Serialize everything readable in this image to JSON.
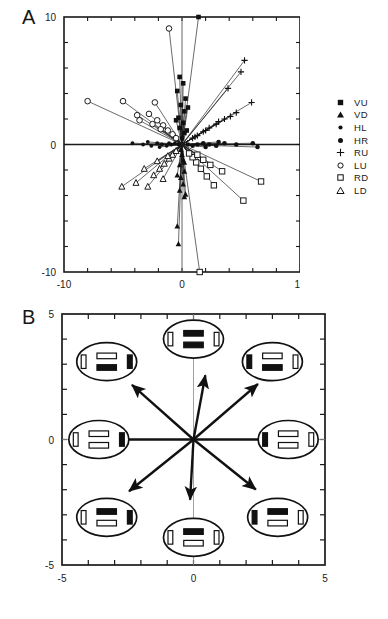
{
  "figure": {
    "panels": [
      {
        "letter": "A",
        "type": "scatter-vector"
      },
      {
        "letter": "B",
        "type": "vector-diagram"
      }
    ]
  },
  "panel_a": {
    "letter": "A",
    "y_ticks": [
      "10",
      "0",
      "-10"
    ],
    "x_ticks": [
      "-10",
      "0",
      "10"
    ],
    "legend": [
      {
        "label": "VU",
        "symbol": "filled-square"
      },
      {
        "label": "VD",
        "symbol": "filled-triangle"
      },
      {
        "label": "HL",
        "symbol": "filled-circle-small"
      },
      {
        "label": "HR",
        "symbol": "filled-circle"
      },
      {
        "label": "RU",
        "symbol": "plus"
      },
      {
        "label": "LU",
        "symbol": "open-circle"
      },
      {
        "label": "RD",
        "symbol": "open-square"
      },
      {
        "label": "LD",
        "symbol": "open-triangle"
      }
    ]
  },
  "panel_b": {
    "letter": "B",
    "y_ticks": [
      "5",
      "0",
      "-5"
    ],
    "x_ticks": [
      "-5",
      "0",
      "5"
    ],
    "icons": [
      {
        "name": "eye-icon-up",
        "direction": "up",
        "top_bar": "black",
        "bottom_bar": "black",
        "left_bar": "white",
        "right_bar": "white"
      },
      {
        "name": "eye-icon-up-left",
        "direction": "up-left",
        "top_bar": "white",
        "bottom_bar": "black",
        "left_bar": "white",
        "right_bar": "black"
      },
      {
        "name": "eye-icon-up-right",
        "direction": "up-right",
        "top_bar": "white",
        "bottom_bar": "black",
        "left_bar": "black",
        "right_bar": "white"
      },
      {
        "name": "eye-icon-left",
        "direction": "left",
        "top_bar": "white",
        "bottom_bar": "white",
        "left_bar": "white",
        "right_bar": "black"
      },
      {
        "name": "eye-icon-right",
        "direction": "right",
        "top_bar": "white",
        "bottom_bar": "white",
        "left_bar": "black",
        "right_bar": "white"
      },
      {
        "name": "eye-icon-down-left",
        "direction": "down-left",
        "top_bar": "black",
        "bottom_bar": "white",
        "left_bar": "white",
        "right_bar": "black"
      },
      {
        "name": "eye-icon-down",
        "direction": "down",
        "top_bar": "black",
        "bottom_bar": "white",
        "left_bar": "white",
        "right_bar": "white"
      },
      {
        "name": "eye-icon-down-right",
        "direction": "down-right",
        "top_bar": "black",
        "bottom_bar": "white",
        "left_bar": "black",
        "right_bar": "white"
      }
    ]
  },
  "chart_data": [
    {
      "type": "scatter",
      "panel": "A",
      "title": "",
      "xlabel": "",
      "ylabel": "",
      "xlim": [
        -10,
        10
      ],
      "ylim": [
        -10,
        10
      ],
      "xticks": [
        -10,
        0,
        10
      ],
      "yticks": [
        -10,
        0,
        10
      ],
      "minor_tick_interval": 2,
      "grid": false,
      "legend_position": "right-outside",
      "description": "Radial vector endpoints from origin; each series is one of eight stimulus directions, lines connect origin to marker endpoints.",
      "series": [
        {
          "name": "VU",
          "marker": "filled-square",
          "points": [
            [
              -0.2,
              5.3
            ],
            [
              0.1,
              4.8
            ],
            [
              -0.4,
              4.2
            ],
            [
              0.3,
              3.6
            ],
            [
              -0.1,
              3.1
            ],
            [
              0.2,
              2.6
            ],
            [
              -0.3,
              2.1
            ],
            [
              0.1,
              1.7
            ],
            [
              -0.2,
              1.3
            ],
            [
              0.2,
              0.9
            ],
            [
              0.0,
              0.5
            ],
            [
              1.4,
              10.0
            ],
            [
              0.5,
              2.9
            ],
            [
              -0.5,
              1.9
            ],
            [
              0.4,
              1.1
            ]
          ]
        },
        {
          "name": "VD",
          "marker": "filled-triangle",
          "points": [
            [
              -0.3,
              -7.8
            ],
            [
              -0.4,
              -6.4
            ],
            [
              0.2,
              -4.1
            ],
            [
              -0.2,
              -3.6
            ],
            [
              0.1,
              -3.1
            ],
            [
              -0.1,
              -2.6
            ],
            [
              0.2,
              -2.1
            ],
            [
              -0.2,
              -1.6
            ],
            [
              0.1,
              -1.2
            ],
            [
              0.0,
              -0.8
            ],
            [
              -0.1,
              -0.4
            ],
            [
              0.3,
              -3.9
            ],
            [
              -0.4,
              -2.4
            ],
            [
              0.2,
              -1.4
            ]
          ]
        },
        {
          "name": "HL",
          "marker": "filled-circle-small",
          "points": [
            [
              -4.2,
              0.1
            ],
            [
              -3.3,
              0.0
            ],
            [
              -2.6,
              -0.1
            ],
            [
              -2.1,
              0.1
            ],
            [
              -1.7,
              0.0
            ],
            [
              -1.3,
              -0.1
            ],
            [
              -0.9,
              0.0
            ],
            [
              -0.6,
              0.1
            ],
            [
              -0.3,
              0.0
            ],
            [
              -2.9,
              0.2
            ],
            [
              -1.9,
              -0.2
            ],
            [
              -1.1,
              0.1
            ]
          ]
        },
        {
          "name": "HR",
          "marker": "filled-circle",
          "points": [
            [
              6.4,
              -0.2
            ],
            [
              6.0,
              0.1
            ],
            [
              4.6,
              0.0
            ],
            [
              3.6,
              0.1
            ],
            [
              2.9,
              -0.1
            ],
            [
              2.3,
              0.0
            ],
            [
              1.8,
              0.1
            ],
            [
              1.3,
              0.0
            ],
            [
              0.9,
              -0.1
            ],
            [
              0.5,
              0.0
            ],
            [
              3.1,
              0.2
            ],
            [
              2.0,
              -0.2
            ]
          ]
        },
        {
          "name": "RU",
          "marker": "plus",
          "points": [
            [
              5.3,
              6.6
            ],
            [
              5.9,
              3.3
            ],
            [
              4.6,
              2.5
            ],
            [
              3.6,
              2.0
            ],
            [
              2.9,
              1.6
            ],
            [
              2.3,
              1.3
            ],
            [
              1.8,
              1.0
            ],
            [
              1.3,
              0.7
            ],
            [
              0.9,
              0.5
            ],
            [
              4.1,
              2.2
            ],
            [
              3.1,
              1.8
            ],
            [
              2.0,
              1.1
            ],
            [
              1.1,
              0.6
            ],
            [
              5.0,
              5.7
            ],
            [
              3.9,
              4.4
            ]
          ]
        },
        {
          "name": "LU",
          "marker": "open-circle",
          "points": [
            [
              -1.1,
              9.1
            ],
            [
              -8.0,
              3.4
            ],
            [
              -5.0,
              3.4
            ],
            [
              -2.3,
              3.3
            ],
            [
              -3.8,
              2.3
            ],
            [
              -3.6,
              1.9
            ],
            [
              -2.8,
              2.4
            ],
            [
              -2.1,
              1.9
            ],
            [
              -1.6,
              1.5
            ],
            [
              -1.2,
              1.1
            ],
            [
              -0.8,
              0.8
            ],
            [
              -0.5,
              0.5
            ],
            [
              -2.5,
              1.6
            ],
            [
              -1.8,
              1.2
            ]
          ]
        },
        {
          "name": "RD",
          "marker": "open-square",
          "points": [
            [
              1.5,
              -10.0
            ],
            [
              6.7,
              -2.9
            ],
            [
              5.2,
              -4.4
            ],
            [
              3.4,
              -2.1
            ],
            [
              2.7,
              -3.2
            ],
            [
              2.1,
              -2.5
            ],
            [
              1.6,
              -1.9
            ],
            [
              1.2,
              -1.4
            ],
            [
              0.9,
              -1.0
            ],
            [
              0.6,
              -0.7
            ],
            [
              2.4,
              -1.6
            ],
            [
              1.8,
              -1.2
            ],
            [
              1.3,
              -0.8
            ]
          ]
        },
        {
          "name": "LD",
          "marker": "open-triangle",
          "points": [
            [
              -5.1,
              -3.3
            ],
            [
              -3.9,
              -3.0
            ],
            [
              -2.9,
              -3.3
            ],
            [
              -2.4,
              -2.4
            ],
            [
              -1.9,
              -1.9
            ],
            [
              -1.5,
              -1.5
            ],
            [
              -1.1,
              -1.1
            ],
            [
              -0.8,
              -0.8
            ],
            [
              -0.5,
              -0.5
            ],
            [
              -2.1,
              -1.3
            ],
            [
              -1.6,
              -2.7
            ],
            [
              -1.2,
              -0.9
            ],
            [
              -3.2,
              -1.9
            ]
          ]
        }
      ]
    },
    {
      "type": "vector-diagram",
      "panel": "B",
      "title": "",
      "xlabel": "",
      "ylabel": "",
      "xlim": [
        -5,
        5
      ],
      "ylim": [
        -5,
        5
      ],
      "xticks": [
        -5,
        0,
        5
      ],
      "yticks": [
        -5,
        0,
        5
      ],
      "minor_tick_interval": 1,
      "grid": false,
      "description": "Eight mean response vectors from origin with schematic eye-position icons at each direction.",
      "vectors": [
        {
          "label": "up",
          "angle_deg": 80,
          "length": 2.6,
          "dx": 0.45,
          "dy": 2.56
        },
        {
          "label": "up-right",
          "angle_deg": 42,
          "length": 3.3,
          "dx": 2.45,
          "dy": 2.21
        },
        {
          "label": "right",
          "angle_deg": 0,
          "length": 3.1,
          "dx": 3.1,
          "dy": 0.0
        },
        {
          "label": "down-right",
          "angle_deg": -40,
          "length": 3.1,
          "dx": 2.37,
          "dy": -1.99
        },
        {
          "label": "down",
          "angle_deg": -93,
          "length": 2.4,
          "dx": -0.13,
          "dy": -2.4
        },
        {
          "label": "down-left",
          "angle_deg": -140,
          "length": 3.2,
          "dx": -2.45,
          "dy": -2.06
        },
        {
          "label": "left",
          "angle_deg": 180,
          "length": 3.0,
          "dx": -3.0,
          "dy": 0.0
        },
        {
          "label": "up-left",
          "angle_deg": 137,
          "length": 3.2,
          "dx": -2.34,
          "dy": 2.18
        }
      ]
    }
  ]
}
